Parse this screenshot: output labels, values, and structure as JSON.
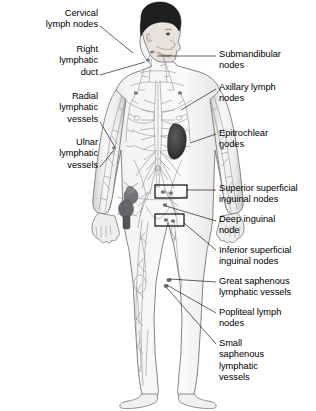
{
  "figure": {
    "width_px": 316,
    "height_px": 411,
    "background_color": "#ffffff",
    "line_color": "#58585a",
    "text_color": "#000000",
    "body_fill": "#f2f2f2",
    "vessel_color": "#8a8a8d",
    "spleen_color": "#3d3d3f",
    "node_cluster_color": "#6e6a70",
    "hair_color": "#1c1c1e"
  },
  "labels": {
    "left": [
      {
        "id": "cervical-lymph-nodes",
        "text": "Cervical\nlymph nodes",
        "x": 5,
        "y": 8,
        "width": 93,
        "leader": [
          [
            100,
            26
          ],
          [
            133,
            53
          ]
        ]
      },
      {
        "id": "right-lymphatic-duct",
        "text": "Right\nlymphatic\nduct",
        "x": 5,
        "y": 44,
        "width": 93,
        "leader": [
          [
            100,
            75
          ],
          [
            145,
            62
          ]
        ]
      },
      {
        "id": "radial-lymphatic-vessels",
        "text": "Radial\nlymphatic\nvessels",
        "x": 5,
        "y": 91,
        "width": 93,
        "leader": [
          [
            100,
            122
          ],
          [
            104,
            146
          ]
        ]
      },
      {
        "id": "ulnar-lymphatic-vessels",
        "text": "Ulnar\nlymphatic\nvessels",
        "x": 5,
        "y": 137,
        "width": 93,
        "leader": [
          [
            100,
            167
          ],
          [
            104,
            151
          ]
        ]
      }
    ],
    "right": [
      {
        "id": "submandibular-nodes",
        "text": "Submandibular\nnodes",
        "x": 219,
        "y": 49,
        "width": 95,
        "leader": [
          [
            216,
            56
          ],
          [
            157,
            56
          ]
        ]
      },
      {
        "id": "axillary-lymph-nodes",
        "text": "Axillary lymph\nnodes",
        "x": 219,
        "y": 82,
        "width": 95,
        "leader": [
          [
            216,
            89
          ],
          [
            181,
            110
          ]
        ]
      },
      {
        "id": "epitrochlear-nodes",
        "text": "Epitrochlear\nnodes",
        "x": 219,
        "y": 128,
        "width": 95,
        "leader": [
          [
            216,
            134
          ],
          [
            189,
            143
          ]
        ]
      },
      {
        "id": "superior-superficial-inguinal-nodes",
        "text": "Superior superficial\ninguinal nodes",
        "x": 219,
        "y": 183,
        "width": 96,
        "leader": [
          [
            216,
            190
          ],
          [
            175,
            190
          ]
        ]
      },
      {
        "id": "deep-inguinal-node",
        "text": "Deep inguinal\nnode",
        "x": 219,
        "y": 214,
        "width": 95,
        "leader": [
          [
            216,
            221
          ],
          [
            167,
            206
          ]
        ]
      },
      {
        "id": "inferior-superficial-inguinal-nodes",
        "text": "Inferior superficial\ninguinal nodes",
        "x": 219,
        "y": 245,
        "width": 96,
        "leader": [
          [
            216,
            250
          ],
          [
            174,
            223
          ]
        ]
      },
      {
        "id": "great-saphenous-lymphatic-vessels",
        "text": "Great saphenous\nlymphatic vessels",
        "x": 219,
        "y": 276,
        "width": 96,
        "leader": [
          [
            216,
            282
          ],
          [
            166,
            278
          ]
        ]
      },
      {
        "id": "popliteal-lymph-nodes",
        "text": "Popliteal lymph\nnodes",
        "x": 219,
        "y": 307,
        "width": 95,
        "leader": [
          [
            216,
            313
          ],
          [
            164,
            284
          ]
        ]
      },
      {
        "id": "small-saphenous-lymphatic-vessels",
        "text": "Small\nsaphenous\nlymphatic\nvessels",
        "x": 219,
        "y": 338,
        "width": 95,
        "leader": [
          [
            216,
            344
          ],
          [
            164,
            288
          ]
        ]
      }
    ]
  },
  "callout_boxes": [
    {
      "id": "superior-inguinal-box",
      "x": 155,
      "y": 185,
      "width": 32,
      "height": 13
    },
    {
      "id": "inferior-inguinal-box",
      "x": 155,
      "y": 214,
      "width": 29,
      "height": 12
    }
  ]
}
